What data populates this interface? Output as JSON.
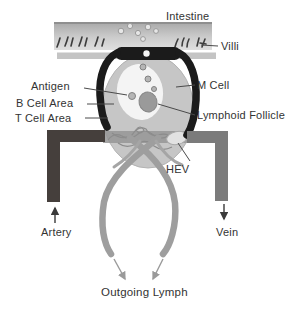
{
  "labels": {
    "intestine": "Intestine",
    "villi": "Villi",
    "antigen": "Antigen",
    "b_cell_area": "B Cell Area",
    "t_cell_area": "T Cell Area",
    "m_cell": "M Cell",
    "lymphoid_follicle": "Lymphoid Follicle",
    "hev": "HEV",
    "artery": "Artery",
    "vein": "Vein",
    "outgoing_lymph": "Outgoing Lymph"
  },
  "colors": {
    "background": "#ffffff",
    "intestine_band_top": "#aaaaaa",
    "intestine_band_bottom": "#dedede",
    "intestine_strip": "#c4c4c4",
    "m_cell_black": "#1b1b1b",
    "follicle_fill": "#c6c6c6",
    "b_cell_white": "#f4f4f4",
    "germinal_center": "#9a9a9a",
    "hev_fill": "#e2e2e2",
    "artery": "#453f3c",
    "vein": "#7b7b7b",
    "lymph_vessel": "#9e9e9e",
    "leader_line": "#4a4a4a",
    "text": "#333333"
  }
}
